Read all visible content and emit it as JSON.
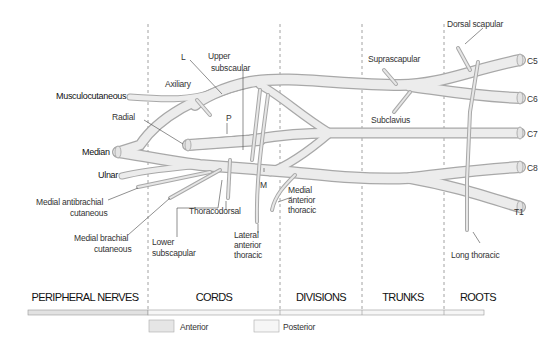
{
  "sections": [
    {
      "label": "PERIPHERAL NERVES",
      "x": 85
    },
    {
      "label": "CORDS",
      "x": 214
    },
    {
      "label": "DIVISIONS",
      "x": 321
    },
    {
      "label": "TRUNKS",
      "x": 403
    },
    {
      "label": "ROOTS",
      "x": 478
    }
  ],
  "roots": {
    "c5": "C5",
    "c6": "C6",
    "c7": "C7",
    "c8": "C8",
    "t1": "T1"
  },
  "peripheral": {
    "musculocutaneous": "Musculocutaneous",
    "median": "Median",
    "ulnar": "Ulnar",
    "radial": "Radial",
    "axiliary": "Axiliary",
    "medial_antibrachial_1": "Medial antibrachial",
    "medial_antibrachial_2": "cutaneous",
    "medial_brachial_1": "Medial brachial",
    "medial_brachial_2": "cutaneous"
  },
  "branches": {
    "dorsal_scapular": "Dorsal scapular",
    "suprascapular": "Suprascapular",
    "subclavius": "Subclavius",
    "long_thoracic": "Long thoracic",
    "upper_subscapular_1": "Upper",
    "upper_subscapular_2": "subscaular",
    "thoracodorsal": "Thoracodorsal",
    "lower_subscapular_1": "Lower",
    "lower_subscapular_2": "subscapular",
    "lateral_anterior_thoracic_1": "Lateral",
    "lateral_anterior_thoracic_2": "anterior",
    "lateral_anterior_thoracic_3": "thoracic",
    "medial_anterior_thoracic_1": "Medial",
    "medial_anterior_thoracic_2": "anterior",
    "medial_anterior_thoracic_3": "thoracic"
  },
  "cords": {
    "lateral": "L",
    "posterior": "P",
    "medial": "M"
  },
  "legend": {
    "anterior": "Anterior",
    "posterior": "Posterior",
    "anterior_color": "#e6e6e6",
    "posterior_color": "#f4f4f4"
  },
  "colors": {
    "nerve_fill": "#e8e8e8",
    "nerve_edge": "#a8a8a8",
    "dashed_line": "#8a8a8a",
    "text": "#222222"
  }
}
